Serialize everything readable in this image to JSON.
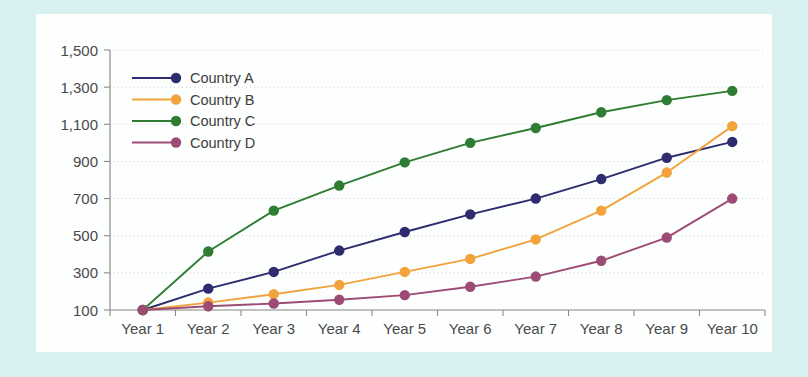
{
  "figure": {
    "frame_color": "#d9f0f1",
    "panel_color": "#fdfefe",
    "title": ""
  },
  "chart_data": {
    "type": "line",
    "title": "",
    "xlabel": "",
    "ylabel": "",
    "categories": [
      "Year 1",
      "Year 2",
      "Year 3",
      "Year 4",
      "Year 5",
      "Year 6",
      "Year 7",
      "Year 8",
      "Year 9",
      "Year 10"
    ],
    "ylim": [
      100,
      1500
    ],
    "yticks": [
      100,
      300,
      500,
      700,
      900,
      1100,
      1300,
      1500
    ],
    "ytick_labels": [
      "100",
      "300",
      "500",
      "700",
      "900",
      "1,100",
      "1,300",
      "1,500"
    ],
    "grid": "horizontal-dotted",
    "legend_position": "upper-left-inside",
    "markers": "filled-circle",
    "series": [
      {
        "name": "Country A",
        "color": "#2c2c6e",
        "values": [
          100,
          215,
          305,
          420,
          520,
          615,
          700,
          805,
          920,
          1005
        ]
      },
      {
        "name": "Country B",
        "color": "#f2a33c",
        "values": [
          100,
          140,
          185,
          235,
          305,
          375,
          480,
          635,
          840,
          1090
        ]
      },
      {
        "name": "Country C",
        "color": "#2e7d32",
        "values": [
          100,
          415,
          635,
          770,
          895,
          1000,
          1080,
          1165,
          1230,
          1280
        ]
      },
      {
        "name": "Country D",
        "color": "#9c4c74",
        "values": [
          100,
          120,
          135,
          155,
          180,
          225,
          280,
          365,
          490,
          700
        ]
      }
    ]
  }
}
